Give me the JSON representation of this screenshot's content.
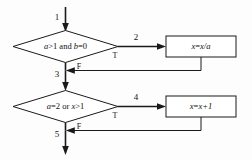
{
  "diagram": {
    "type": "flowchart",
    "background_color": "#fdfdfd",
    "line_color": "#1a1a1a",
    "text_color": "#111111",
    "nodes": [
      {
        "id": "decision1",
        "shape": "diamond",
        "text": "a>1 and b=0",
        "text_parts": {
          "var1": "a",
          "op1": ">1 and ",
          "var2": "b",
          "op2": "=0"
        }
      },
      {
        "id": "process1",
        "shape": "rectangle",
        "text": "x=x/a",
        "text_parts": {
          "lhs": "x",
          "eq": "=",
          "rhs": "x/a"
        }
      },
      {
        "id": "decision2",
        "shape": "diamond",
        "text": "a=2 or x>1",
        "text_parts": {
          "var1": "a",
          "op1": "=2 or ",
          "var2": "x",
          "op2": ">1"
        }
      },
      {
        "id": "process2",
        "shape": "rectangle",
        "text": "x=x+1",
        "text_parts": {
          "lhs": "x",
          "eq": "=",
          "rhs": "x+1"
        }
      }
    ],
    "edge_numbers": {
      "entry": "1",
      "true_branch_top": "2",
      "merge_middle": "3",
      "true_branch_bottom": "4",
      "exit": "5"
    },
    "branch_labels": {
      "decision1_true": "T",
      "decision1_false": "F",
      "decision2_true": "T",
      "decision2_false": "F"
    }
  }
}
